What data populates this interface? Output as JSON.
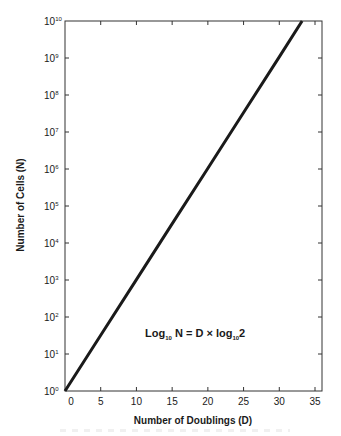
{
  "chart_data": {
    "type": "line",
    "title": "",
    "xlabel": "Number of Doublings (D)",
    "ylabel": "Number of Cells (N)",
    "xscale": "linear",
    "yscale": "log",
    "xlim": [
      0,
      35.8
    ],
    "ylim": [
      1,
      10000000000
    ],
    "x_ticks": [
      0,
      5,
      10,
      15,
      20,
      25,
      30,
      35
    ],
    "x_tick_labels": [
      "0",
      "5",
      "10",
      "15",
      "20",
      "25",
      "30",
      "35"
    ],
    "y_ticks_exponents": [
      0,
      1,
      2,
      3,
      4,
      5,
      6,
      7,
      8,
      9,
      10
    ],
    "y_tick_labels": [
      "10^0",
      "10^1",
      "10^2",
      "10^3",
      "10^4",
      "10^5",
      "10^6",
      "10^7",
      "10^8",
      "10^9",
      "10^10"
    ],
    "grid": false,
    "legend": null,
    "annotations": [
      {
        "text": "Log10 N = D × log10 2",
        "position": "lower-center inside plot"
      }
    ],
    "series": [
      {
        "name": "N = 2^D",
        "x": [
          0,
          5,
          10,
          15,
          20,
          25,
          30,
          33.2
        ],
        "y": [
          1,
          32,
          1024,
          32768,
          1048576,
          33554432,
          1073741824,
          10000000000
        ]
      }
    ]
  },
  "axes": {
    "x_title": "Number of Doublings (D)",
    "y_title": "Number of Cells (N)",
    "x_labels": [
      "0",
      "5",
      "10",
      "15",
      "20",
      "25",
      "30",
      "35"
    ],
    "y_labels": [
      {
        "base": "10",
        "exp": "0"
      },
      {
        "base": "10",
        "exp": "1"
      },
      {
        "base": "10",
        "exp": "2"
      },
      {
        "base": "10",
        "exp": "3"
      },
      {
        "base": "10",
        "exp": "4"
      },
      {
        "base": "10",
        "exp": "5"
      },
      {
        "base": "10",
        "exp": "6"
      },
      {
        "base": "10",
        "exp": "7"
      },
      {
        "base": "10",
        "exp": "8"
      },
      {
        "base": "10",
        "exp": "9"
      },
      {
        "base": "10",
        "exp": "10"
      }
    ]
  },
  "formula": {
    "log1": "Log",
    "sub1": "10",
    "middle": " N = D × log",
    "sub2": "10",
    "end": "2"
  },
  "colors": {
    "line": "#1a1a1a",
    "frame": "#333333",
    "background": "#ffffff"
  }
}
